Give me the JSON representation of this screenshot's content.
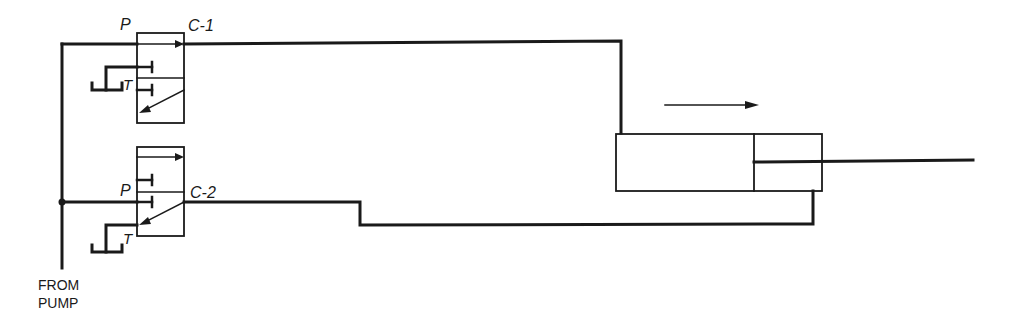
{
  "diagram": {
    "type": "hydraulic-circuit",
    "labels": {
      "valve1_pressure": "P",
      "valve1_cylinder": "C-1",
      "valve1_tank": "T",
      "valve2_pressure": "P",
      "valve2_cylinder": "C-2",
      "valve2_tank": "T",
      "pump_line1": "FROM",
      "pump_line2": "PUMP"
    },
    "components": [
      {
        "id": "valve-1",
        "kind": "directional-control-valve",
        "ports": [
          "P",
          "C-1",
          "T"
        ]
      },
      {
        "id": "valve-2",
        "kind": "directional-control-valve",
        "ports": [
          "P",
          "C-2",
          "T"
        ]
      },
      {
        "id": "cylinder",
        "kind": "double-acting-cylinder",
        "motion": "extend-right"
      }
    ],
    "connections": [
      {
        "from": "pump",
        "to": "valve-1.P"
      },
      {
        "from": "pump",
        "to": "valve-2.P"
      },
      {
        "from": "valve-1.C-1",
        "to": "cylinder.cap-end"
      },
      {
        "from": "valve-2.C-2",
        "to": "cylinder.rod-end"
      }
    ],
    "colors": {
      "line": "#1a1a1a",
      "background": "#ffffff"
    }
  }
}
